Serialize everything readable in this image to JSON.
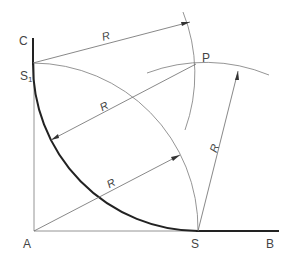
{
  "diagram": {
    "points": {
      "A": {
        "label": "A",
        "x": 34,
        "y": 231
      },
      "C": {
        "label": "C",
        "x": 33,
        "y": 38
      },
      "S1": {
        "label": "S",
        "subscript": "1",
        "x": 33,
        "y": 63
      },
      "S": {
        "label": "S",
        "x": 198,
        "y": 231
      },
      "B": {
        "label": "B",
        "x": 279,
        "y": 231
      },
      "P": {
        "label": "P",
        "x": 196,
        "y": 64
      }
    },
    "labels": {
      "C": "C",
      "S1": "S",
      "S1_sub": "1",
      "P": "P",
      "A": "A",
      "S": "S",
      "B": "B"
    },
    "radius_labels": [
      "R",
      "R",
      "R",
      "R"
    ],
    "radius": 166,
    "colors": {
      "construction_line": "#7a7a7a",
      "result_arc": "#222222",
      "text": "#444444"
    }
  }
}
